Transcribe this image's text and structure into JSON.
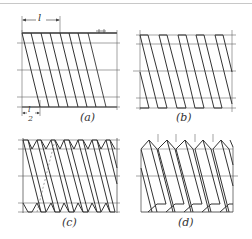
{
  "figure": {
    "panels": [
      {
        "id": "a",
        "label": "(a)",
        "description": "Single-start helix lines with lead l and half-lead l/2 dimensions"
      },
      {
        "id": "b",
        "label": "(b)",
        "description": "Helix outlines with flat crests on major/minor diameters"
      },
      {
        "id": "c",
        "label": "(c)",
        "description": "V-thread helix profile with hidden back line"
      },
      {
        "id": "d",
        "label": "(d)",
        "description": "Completed square-thread view"
      }
    ],
    "dimensions": {
      "lead": "l",
      "half_lead_num": "l",
      "half_lead_den": "2"
    },
    "colors": {
      "line": "#333333",
      "construction": "#6e6e6e",
      "background": "#ffffff"
    }
  }
}
